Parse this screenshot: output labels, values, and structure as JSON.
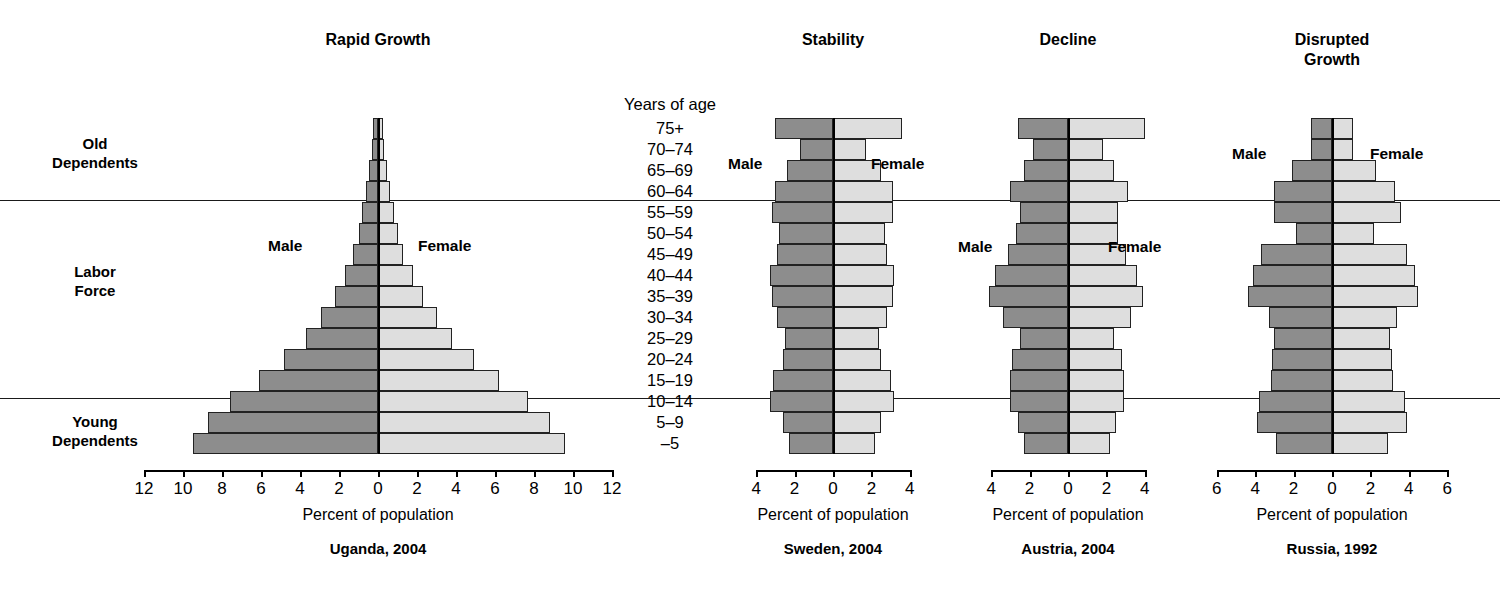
{
  "figure": {
    "axis_label": "Percent of population",
    "age_axis_title": "Years of age",
    "male_label": "Male",
    "female_label": "Female",
    "colors": {
      "male_fill": "#8d8d8d",
      "female_fill": "#dedede",
      "outline": "#222222"
    },
    "group_labels": [
      {
        "name": "old-dependents",
        "text": "Old\nDependents"
      },
      {
        "name": "labor-force",
        "text": "Labor\nForce"
      },
      {
        "name": "young-dependents",
        "text": "Young\nDependents"
      }
    ],
    "age_groups": [
      "75+",
      "70–74",
      "65–69",
      "60–64",
      "55–59",
      "50–54",
      "45–49",
      "40–44",
      "35–39",
      "30–34",
      "25–29",
      "20–24",
      "15–19",
      "10–14",
      "5–9",
      "–5"
    ]
  },
  "chart_data": [
    {
      "type": "bar",
      "name": "uganda",
      "title": "Rapid Growth",
      "caption": "Uganda, 2004",
      "xlabel": "Percent of population",
      "ylabel": "Years of age",
      "categories": [
        "75+",
        "70–74",
        "65–69",
        "60–64",
        "55–59",
        "50–54",
        "45–49",
        "40–44",
        "35–39",
        "30–34",
        "25–29",
        "20–24",
        "15–19",
        "10–14",
        "5–9",
        "–5"
      ],
      "xticks": [
        12,
        10,
        8,
        6,
        4,
        2,
        0,
        2,
        4,
        6,
        8,
        10,
        12
      ],
      "xlim": [
        12,
        12
      ],
      "series": [
        {
          "name": "Male",
          "values": [
            0.25,
            0.3,
            0.45,
            0.6,
            0.8,
            1.0,
            1.3,
            1.7,
            2.2,
            2.9,
            3.7,
            4.8,
            6.1,
            7.6,
            8.7,
            9.5
          ]
        },
        {
          "name": "Female",
          "values": [
            0.25,
            0.3,
            0.45,
            0.6,
            0.8,
            1.0,
            1.3,
            1.8,
            2.3,
            3.0,
            3.8,
            4.9,
            6.2,
            7.7,
            8.8,
            9.6
          ]
        }
      ]
    },
    {
      "type": "bar",
      "name": "sweden",
      "title": "Stability",
      "caption": "Sweden, 2004",
      "xlabel": "Percent of population",
      "ylabel": "Years of age",
      "categories": [
        "75+",
        "70–74",
        "65–69",
        "60–64",
        "55–59",
        "50–54",
        "45–49",
        "40–44",
        "35–39",
        "30–34",
        "25–29",
        "20–24",
        "15–19",
        "10–14",
        "5–9",
        "–5"
      ],
      "xticks": [
        4,
        2,
        0,
        2,
        4
      ],
      "xlim": [
        4,
        4
      ],
      "series": [
        {
          "name": "Male",
          "values": [
            3.0,
            1.7,
            2.4,
            3.0,
            3.2,
            2.8,
            2.9,
            3.3,
            3.2,
            2.9,
            2.5,
            2.6,
            3.1,
            3.3,
            2.6,
            2.3
          ]
        },
        {
          "name": "Female",
          "values": [
            3.6,
            1.7,
            2.5,
            3.1,
            3.1,
            2.7,
            2.8,
            3.2,
            3.1,
            2.8,
            2.4,
            2.5,
            3.0,
            3.2,
            2.5,
            2.2
          ]
        }
      ]
    },
    {
      "type": "bar",
      "name": "austria",
      "title": "Decline",
      "caption": "Austria, 2004",
      "xlabel": "Percent of population",
      "ylabel": "Years of age",
      "categories": [
        "75+",
        "70–74",
        "65–69",
        "60–64",
        "55–59",
        "50–54",
        "45–49",
        "40–44",
        "35–39",
        "30–34",
        "25–29",
        "20–24",
        "15–19",
        "10–14",
        "5–9",
        "–5"
      ],
      "xticks": [
        4,
        2,
        0,
        2,
        4
      ],
      "xlim": [
        4,
        4
      ],
      "series": [
        {
          "name": "Male",
          "values": [
            2.6,
            1.8,
            2.3,
            3.0,
            2.5,
            2.7,
            3.1,
            3.8,
            4.1,
            3.4,
            2.5,
            2.9,
            3.0,
            3.0,
            2.6,
            2.3
          ]
        },
        {
          "name": "Female",
          "values": [
            4.0,
            1.8,
            2.4,
            3.1,
            2.6,
            2.6,
            3.0,
            3.6,
            3.9,
            3.3,
            2.4,
            2.8,
            2.9,
            2.9,
            2.5,
            2.2
          ]
        }
      ]
    },
    {
      "type": "bar",
      "name": "russia",
      "title": "Disrupted\nGrowth",
      "caption": "Russia, 1992",
      "xlabel": "Percent of population",
      "ylabel": "Years of age",
      "categories": [
        "75+",
        "70–74",
        "65–69",
        "60–64",
        "55–59",
        "50–54",
        "45–49",
        "40–44",
        "35–39",
        "30–34",
        "25–29",
        "20–24",
        "15–19",
        "10–14",
        "5–9",
        "–5"
      ],
      "xticks": [
        6,
        4,
        2,
        0,
        2,
        4,
        6
      ],
      "xlim": [
        6,
        6
      ],
      "series": [
        {
          "name": "Male",
          "values": [
            1.1,
            1.1,
            2.1,
            3.0,
            3.0,
            1.9,
            3.7,
            4.1,
            4.4,
            3.3,
            3.0,
            3.1,
            3.2,
            3.8,
            3.9,
            2.9
          ]
        },
        {
          "name": "Female",
          "values": [
            1.1,
            1.1,
            2.3,
            3.3,
            3.6,
            2.2,
            3.9,
            4.3,
            4.5,
            3.4,
            3.0,
            3.1,
            3.2,
            3.8,
            3.9,
            2.9
          ]
        }
      ]
    }
  ]
}
